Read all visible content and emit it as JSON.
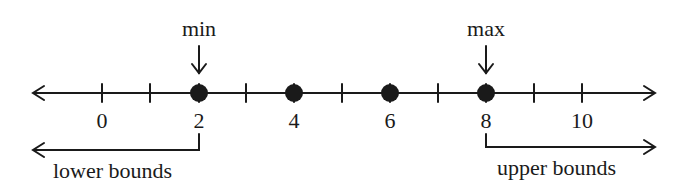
{
  "diagram": {
    "title_min": "min",
    "title_max": "max",
    "lower_label": "lower bounds",
    "upper_label": "upper bounds",
    "axis": {
      "tick_values": [
        0,
        1,
        2,
        3,
        4,
        5,
        6,
        7,
        8,
        9,
        10
      ],
      "labeled_ticks": [
        "0",
        "2",
        "4",
        "6",
        "8",
        "10"
      ]
    },
    "points": [
      2,
      4,
      6,
      8
    ],
    "min_value": 2,
    "max_value": 8,
    "colors": {
      "ink": "#1a1a1a",
      "background": "#ffffff"
    }
  }
}
